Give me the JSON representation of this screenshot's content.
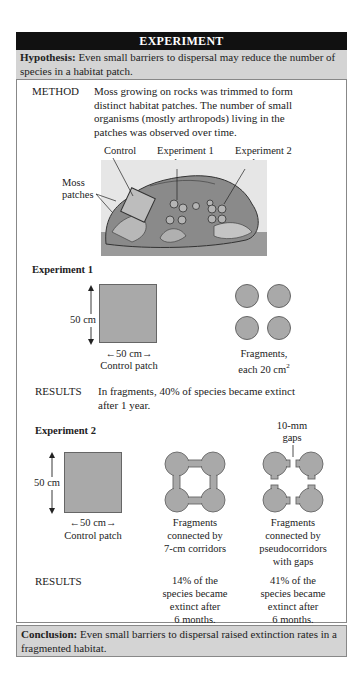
{
  "header": {
    "title": "EXPERIMENT"
  },
  "hypothesis": {
    "label": "Hypothesis:",
    "text": " Even small barriers to dispersal may reduce the number of species in a habitat patch."
  },
  "method": {
    "label": "METHOD",
    "lines": [
      "Moss growing on rocks was trimmed to form",
      "distinct habitat patches. The number of small",
      "organisms (mostly arthropods) living in the",
      "patches was observed over time."
    ]
  },
  "illustration": {
    "labels": {
      "control": "Control",
      "exp1_line1": "Experiment 1",
      "exp1_line2": "patches",
      "exp2_line1": "Experiment 2",
      "exp2_line2": "patch",
      "moss_line1": "Moss",
      "moss_line2": "patches"
    },
    "colors": {
      "rock": "#8a8a8a",
      "rock_dark": "#555555",
      "ground": "#9a9a9a",
      "moss": "#b8b8b8"
    }
  },
  "experiment1": {
    "title": "Experiment 1",
    "control": {
      "height_label": "50 cm",
      "width_label": "50 cm",
      "caption": "Control patch"
    },
    "fragments": {
      "caption_line1": "Fragments,",
      "caption_line2": "each 20 cm",
      "superscript": "2",
      "count": 4
    },
    "results": {
      "label": "RESULTS",
      "line1": "In fragments, 40% of species became extinct",
      "line2": "after 1 year."
    }
  },
  "experiment2": {
    "title": "Experiment 2",
    "control": {
      "height_label": "50 cm",
      "width_label": "50 cm",
      "caption": "Control patch"
    },
    "corridors": {
      "caption": [
        "Fragments",
        "connected by",
        "7-cm corridors"
      ]
    },
    "pseudo": {
      "gap_label": [
        "10-mm",
        "gaps"
      ],
      "caption": [
        "Fragments",
        "connected by",
        "pseudocorridors",
        "with gaps"
      ]
    },
    "results": {
      "label": "RESULTS",
      "corridors": [
        "14% of the",
        "species became",
        "extinct after",
        "6 months."
      ],
      "pseudo": [
        "41% of the",
        "species became",
        "extinct after",
        "6 months."
      ]
    }
  },
  "conclusion": {
    "label": "Conclusion:",
    "text": " Even small barriers to dispersal raised extinction rates in a fragmented habitat."
  },
  "colors": {
    "header_bg": "#111111",
    "band_bg": "#d4d4d4",
    "patch_fill": "#a9a9a9",
    "border": "#888888"
  }
}
